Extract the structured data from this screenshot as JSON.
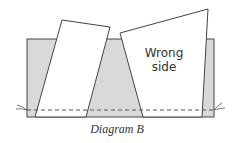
{
  "diagram": {
    "title": "Diagram B",
    "label_line1": "Wrong",
    "label_line2": "side",
    "colors": {
      "background_fabric": "#d9d9d9",
      "panel_fill": "#ffffff",
      "stroke": "#444444",
      "stitch_line": "#555555"
    },
    "shapes": {
      "background_fabric": {
        "x": 27,
        "y": 39,
        "width": 187,
        "height": 78
      },
      "left_panel": [
        [
          62,
          20
        ],
        [
          110,
          27
        ],
        [
          86,
          117
        ],
        [
          35,
          117
        ]
      ],
      "right_panel": [
        [
          120,
          33
        ],
        [
          208,
          9
        ],
        [
          202,
          117
        ],
        [
          143,
          117
        ]
      ],
      "stitch_line_y": 110
    }
  }
}
